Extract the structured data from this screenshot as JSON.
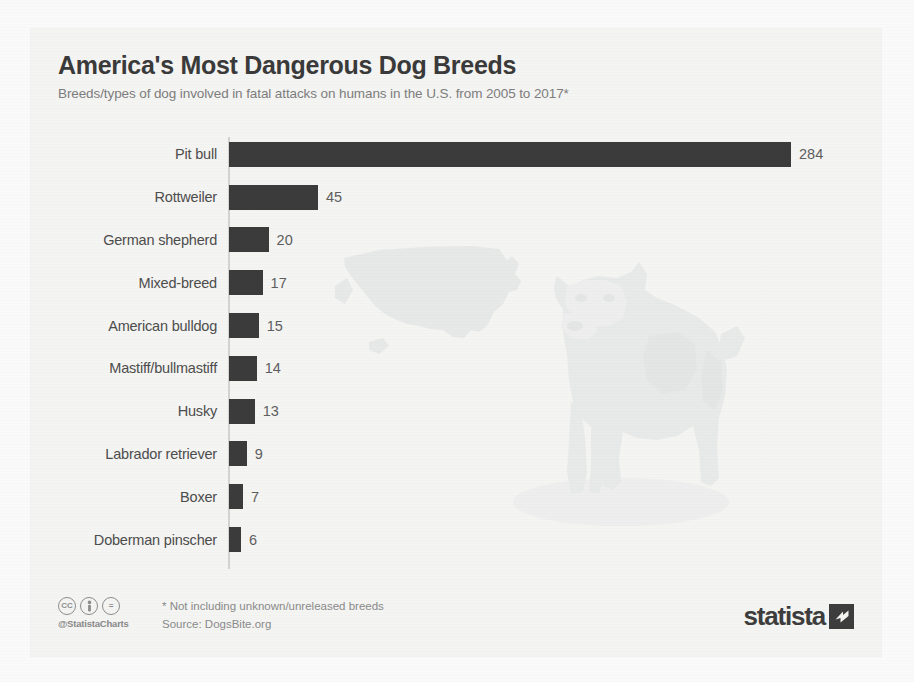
{
  "header": {
    "title": "America's Most Dangerous Dog Breeds",
    "subtitle": "Breeds/types of dog involved in fatal attacks on humans in the U.S. from 2005 to 2017*"
  },
  "footer": {
    "cc_icons": [
      "cc",
      "by-person-icon",
      "nd-equals-icon"
    ],
    "cc_label_cc": "cc",
    "cc_label_by": "὆4",
    "cc_label_nd": "=",
    "handle": "@StatistaCharts",
    "footnote": "* Not including unknown/unreleased breeds",
    "source": "Source: DogsBite.org",
    "brand_word": "statista"
  },
  "colors": {
    "bar": "#3b3b3b",
    "card_background": "#f4f4f2",
    "title": "#3a3a3a",
    "subtitle": "#7d7d7d",
    "label": "#4d4d4d",
    "value": "#5e5e5e",
    "axis": "#d3d3d0"
  },
  "background_art": {
    "us_map": "us-map-watermark",
    "dog": "pit-bull-illustration"
  },
  "chart_data": {
    "type": "bar",
    "orientation": "horizontal",
    "title": "America's Most Dangerous Dog Breeds",
    "subtitle": "Breeds/types of dog involved in fatal attacks on humans in the U.S. from 2005 to 2017*",
    "xlabel": "",
    "ylabel": "",
    "xlim": [
      0,
      284
    ],
    "grid": false,
    "legend": false,
    "categories": [
      "Pit bull",
      "Rottweiler",
      "German shepherd",
      "Mixed-breed",
      "American bulldog",
      "Mastiff/bullmastiff",
      "Husky",
      "Labrador retriever",
      "Boxer",
      "Doberman pinscher"
    ],
    "values": [
      284,
      45,
      20,
      17,
      15,
      14,
      13,
      9,
      7,
      6
    ],
    "value_labels": [
      "284",
      "45",
      "20",
      "17",
      "15",
      "14",
      "13",
      "9",
      "7",
      "6"
    ],
    "unit": "fatal attacks on humans",
    "source": "DogsBite.org"
  }
}
